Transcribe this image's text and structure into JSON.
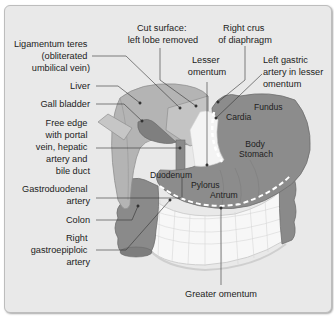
{
  "diagram": {
    "colors": {
      "background": "#e9e9e9",
      "frame_border": "#bdbdbd",
      "liver": "#b4b4b4",
      "liver_dark": "#9e9e9e",
      "stomach": "#8c8c8c",
      "gallbladder": "#7f7f7f",
      "colon": "#8a8a8a",
      "omentum": "#f7f7f7",
      "leader_line": "#333333",
      "text": "#222222"
    },
    "labels_left": {
      "ligamentum_teres": [
        "Ligamentum teres",
        "(obliterated",
        "umbilical vein)"
      ],
      "liver": [
        "Liver"
      ],
      "gall_bladder": [
        "Gall bladder"
      ],
      "free_edge": [
        "Free edge",
        "with portal",
        "vein, hepatic",
        "artery and",
        "bile duct"
      ],
      "gastroduodenal_artery": [
        "Gastroduodenal",
        "artery"
      ],
      "colon": [
        "Colon"
      ],
      "right_gastroepiploic_artery": [
        "Right",
        "gastroepiploic",
        "artery"
      ]
    },
    "labels_top": {
      "cut_surface": [
        "Cut surface:",
        "left lobe removed"
      ],
      "right_crus": [
        "Right crus",
        "of diaphragm"
      ],
      "lesser_omentum": [
        "Lesser",
        "omentum"
      ],
      "left_gastric_artery": [
        "Left gastric",
        "artery in lesser",
        "omentum"
      ]
    },
    "labels_inner": {
      "fundus": "Fundus",
      "cardia": "Cardia",
      "body": "Body",
      "stomach": "Stomach",
      "duodenum": "Duodenum",
      "pylorus": "Pylorus",
      "antrum": "Antrum"
    },
    "labels_bottom": {
      "greater_omentum": "Greater omentum"
    }
  }
}
